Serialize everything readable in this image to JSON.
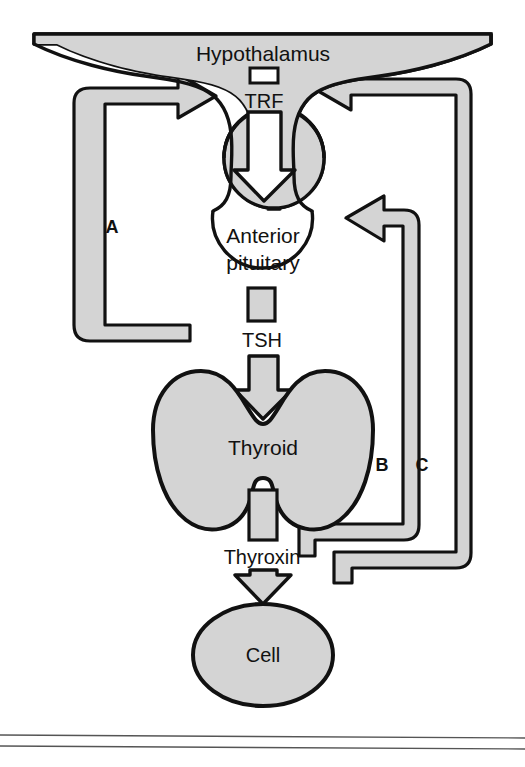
{
  "figure": {
    "type": "flow-diagram",
    "background_color": "#ffffff",
    "fill_color": "#d4d4d4",
    "stroke_color": "#111111",
    "white_fill": "#ffffff"
  },
  "nodes": {
    "hypothalamus": {
      "label": "Hypothalamus",
      "shape": "winged-gland"
    },
    "anterior_pituitary": {
      "label_line1": "Anterior",
      "label_line2": "pituitary",
      "shape": "circle"
    },
    "thyroid": {
      "label": "Thyroid",
      "shape": "butterfly-gland"
    },
    "cell": {
      "label": "Cell",
      "shape": "ellipse"
    }
  },
  "hormones": {
    "trf": {
      "label": "TRF",
      "marker": "white-rectangle"
    },
    "tsh": {
      "label": "TSH",
      "marker": "gray-rectangle"
    },
    "thyroxin": {
      "label": "Thyroxin",
      "marker": "gray-rectangle"
    }
  },
  "feedback_loops": [
    {
      "id": "A",
      "label": "A",
      "from": "anterior-pituitary",
      "to": "hypothalamus",
      "side": "left",
      "arrow_direction": "right"
    },
    {
      "id": "B",
      "label": "B",
      "from": "thyroid",
      "to": "anterior-pituitary",
      "side": "right",
      "arrow_direction": "left"
    },
    {
      "id": "C",
      "label": "C",
      "from": "thyroxin",
      "to": "hypothalamus",
      "side": "right",
      "arrow_direction": "left"
    }
  ],
  "flow_arrows": [
    {
      "from": "hypothalamus",
      "to": "anterior-pituitary",
      "via": "TRF",
      "direction": "down"
    },
    {
      "from": "anterior-pituitary",
      "to": "thyroid",
      "via": "TSH",
      "direction": "down"
    },
    {
      "from": "thyroid",
      "to": "cell",
      "via": "Thyroxin",
      "direction": "down"
    }
  ],
  "footer_rules": {
    "count": 2
  }
}
